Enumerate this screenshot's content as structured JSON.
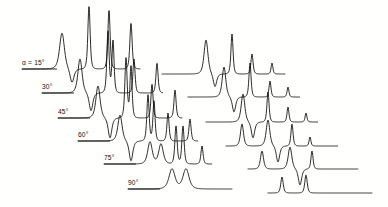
{
  "figure": {
    "type": "stacked-spectra",
    "background_color": "#ffffff",
    "line_color": "#141414",
    "width": 388,
    "height": 207
  },
  "labels": {
    "trace_1": "α = 15°",
    "trace_2": "30°",
    "trace_3": "45°",
    "trace_4": "60°",
    "trace_5": "75°",
    "trace_6": "90°"
  },
  "chart_data": {
    "type": "line",
    "title": "",
    "xlabel": "",
    "ylabel": "",
    "grid": false,
    "legend": "none",
    "xlim": [
      0,
      388
    ],
    "ylim": [
      207,
      0
    ],
    "note": "Each series is one spectrum trace; baseline_y is the flat-line level in pixel coords, x_start/x_end the horizontal extent. Peaks list gives x position, signed amplitude in px (negative = upward spike, positive = downward dip) and half-width in px.",
    "series": [
      {
        "name": "α = 15°",
        "angle_deg": 15,
        "baseline_y": 69,
        "x_start": 22,
        "x_end": 140,
        "label_x": 22,
        "label_y": 65,
        "label_rule": [
          22,
          69,
          57,
          69
        ],
        "peaks": [
          {
            "x": 62,
            "amp": -36,
            "width": 3.2
          },
          {
            "x": 72,
            "amp": 14,
            "width": 2.6
          },
          {
            "x": 89,
            "amp": -63,
            "width": 1.5
          },
          {
            "x": 109,
            "amp": -59,
            "width": 1.5
          },
          {
            "x": 131,
            "amp": -46,
            "width": 1.5
          }
        ]
      },
      {
        "name": "α = 15° right group",
        "angle_deg": 15,
        "baseline_y": 74,
        "x_start": 162,
        "x_end": 285,
        "label_x": null,
        "label_y": null,
        "label_rule": null,
        "peaks": [
          {
            "x": 206,
            "amp": -34,
            "width": 2.6
          },
          {
            "x": 215,
            "amp": 13,
            "width": 2.2
          },
          {
            "x": 232,
            "amp": -40,
            "width": 1.4
          },
          {
            "x": 252,
            "amp": -20,
            "width": 1.4
          },
          {
            "x": 272,
            "amp": -11,
            "width": 1.2
          }
        ]
      },
      {
        "name": "30°",
        "angle_deg": 30,
        "baseline_y": 93,
        "x_start": 42,
        "x_end": 163,
        "label_x": 42,
        "label_y": 89,
        "label_rule": [
          42,
          93,
          74,
          93
        ],
        "peaks": [
          {
            "x": 80,
            "amp": -34,
            "width": 2.8
          },
          {
            "x": 91,
            "amp": 18,
            "width": 2.4
          },
          {
            "x": 108,
            "amp": -62,
            "width": 1.5
          },
          {
            "x": 113,
            "amp": -52,
            "width": 1.4
          },
          {
            "x": 134,
            "amp": -34,
            "width": 1.4
          },
          {
            "x": 157,
            "amp": -30,
            "width": 1.4
          }
        ]
      },
      {
        "name": "30° right group",
        "angle_deg": 30,
        "baseline_y": 97,
        "x_start": 188,
        "x_end": 300,
        "label_x": null,
        "label_y": null,
        "label_rule": null,
        "peaks": [
          {
            "x": 224,
            "amp": -30,
            "width": 2.4
          },
          {
            "x": 234,
            "amp": 15,
            "width": 2.2
          },
          {
            "x": 250,
            "amp": -34,
            "width": 1.4
          },
          {
            "x": 270,
            "amp": -16,
            "width": 1.3
          },
          {
            "x": 288,
            "amp": -10,
            "width": 1.2
          }
        ]
      },
      {
        "name": "45°",
        "angle_deg": 45,
        "baseline_y": 118,
        "x_start": 58,
        "x_end": 182,
        "label_x": 58,
        "label_y": 114,
        "label_rule": [
          58,
          118,
          90,
          118
        ],
        "peaks": [
          {
            "x": 98,
            "amp": -32,
            "width": 2.8
          },
          {
            "x": 110,
            "amp": 20,
            "width": 2.4
          },
          {
            "x": 126,
            "amp": -60,
            "width": 1.5
          },
          {
            "x": 131,
            "amp": -52,
            "width": 1.4
          },
          {
            "x": 152,
            "amp": -34,
            "width": 1.4
          },
          {
            "x": 175,
            "amp": -28,
            "width": 1.4
          }
        ]
      },
      {
        "name": "45° right group",
        "angle_deg": 45,
        "baseline_y": 122,
        "x_start": 206,
        "x_end": 318,
        "label_x": null,
        "label_y": null,
        "label_rule": null,
        "peaks": [
          {
            "x": 243,
            "amp": -28,
            "width": 2.4
          },
          {
            "x": 253,
            "amp": 16,
            "width": 2.2
          },
          {
            "x": 268,
            "amp": -30,
            "width": 1.4
          },
          {
            "x": 288,
            "amp": -15,
            "width": 1.3
          },
          {
            "x": 306,
            "amp": -9,
            "width": 1.2
          }
        ]
      },
      {
        "name": "60°",
        "angle_deg": 60,
        "baseline_y": 141,
        "x_start": 78,
        "x_end": 198,
        "label_x": 78,
        "label_y": 137,
        "label_rule": [
          78,
          141,
          110,
          141
        ],
        "peaks": [
          {
            "x": 120,
            "amp": -26,
            "width": 2.8
          },
          {
            "x": 131,
            "amp": 20,
            "width": 2.4
          },
          {
            "x": 148,
            "amp": -46,
            "width": 1.5
          },
          {
            "x": 154,
            "amp": -40,
            "width": 1.4
          },
          {
            "x": 168,
            "amp": -28,
            "width": 1.4
          },
          {
            "x": 190,
            "amp": -22,
            "width": 1.4
          }
        ]
      },
      {
        "name": "60° right group",
        "angle_deg": 60,
        "baseline_y": 146,
        "x_start": 226,
        "x_end": 338,
        "label_x": null,
        "label_y": null,
        "label_rule": null,
        "peaks": [
          {
            "x": 242,
            "amp": -22,
            "width": 2.0
          },
          {
            "x": 268,
            "amp": -26,
            "width": 2.4
          },
          {
            "x": 278,
            "amp": 16,
            "width": 2.2
          },
          {
            "x": 292,
            "amp": -22,
            "width": 1.4
          },
          {
            "x": 310,
            "amp": -9,
            "width": 1.2
          }
        ]
      },
      {
        "name": "75°",
        "angle_deg": 75,
        "baseline_y": 164,
        "x_start": 104,
        "x_end": 212,
        "label_x": 104,
        "label_y": 160,
        "label_rule": [
          104,
          164,
          136,
          164
        ],
        "peaks": [
          {
            "x": 150,
            "amp": -22,
            "width": 3.0
          },
          {
            "x": 161,
            "amp": -20,
            "width": 3.0
          },
          {
            "x": 176,
            "amp": -38,
            "width": 1.5
          },
          {
            "x": 183,
            "amp": -38,
            "width": 1.5
          },
          {
            "x": 202,
            "amp": -18,
            "width": 1.4
          }
        ]
      },
      {
        "name": "75° right group",
        "angle_deg": 75,
        "baseline_y": 169,
        "x_start": 248,
        "x_end": 358,
        "label_x": null,
        "label_y": null,
        "label_rule": null,
        "peaks": [
          {
            "x": 262,
            "amp": -18,
            "width": 2.0
          },
          {
            "x": 290,
            "amp": -22,
            "width": 2.4
          },
          {
            "x": 300,
            "amp": 16,
            "width": 2.2
          },
          {
            "x": 312,
            "amp": -18,
            "width": 1.4
          }
        ]
      },
      {
        "name": "90°",
        "angle_deg": 90,
        "baseline_y": 189,
        "x_start": 128,
        "x_end": 232,
        "label_x": 128,
        "label_y": 185,
        "label_rule": [
          128,
          189,
          160,
          189
        ],
        "peaks": [
          {
            "x": 172,
            "amp": -20,
            "width": 4.0
          },
          {
            "x": 186,
            "amp": -20,
            "width": 4.0
          }
        ]
      },
      {
        "name": "90° right group",
        "angle_deg": 90,
        "baseline_y": 193,
        "x_start": 268,
        "x_end": 372,
        "label_x": null,
        "label_y": null,
        "label_rule": null,
        "peaks": [
          {
            "x": 282,
            "amp": -16,
            "width": 1.6
          },
          {
            "x": 306,
            "amp": -18,
            "width": 1.6
          }
        ]
      }
    ]
  }
}
